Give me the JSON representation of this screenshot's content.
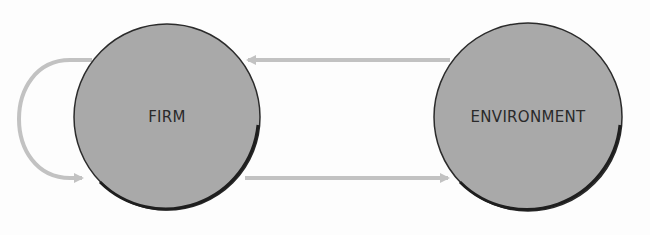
{
  "diagram": {
    "type": "cycle",
    "nodes": [
      {
        "id": "firm",
        "label": "FIRM"
      },
      {
        "id": "environment",
        "label": "ENVIRONMENT"
      }
    ],
    "edges": [
      {
        "from": "environment",
        "to": "firm",
        "label": ""
      },
      {
        "from": "firm",
        "to": "environment",
        "label": ""
      },
      {
        "from": "firm",
        "to": "firm",
        "label": ""
      }
    ]
  },
  "colors": {
    "node_fill": "#a9a9a9",
    "node_stroke": "#2b2b2b",
    "arrow": "#c2c2c2",
    "label": "#2a2a2a"
  }
}
